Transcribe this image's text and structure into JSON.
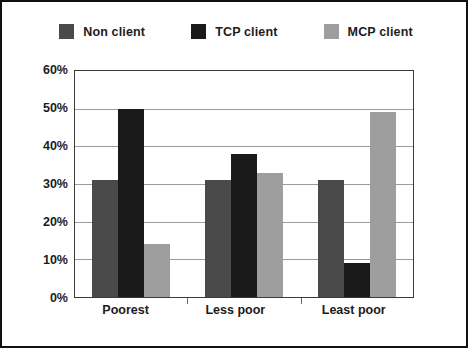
{
  "legend": {
    "entries": [
      {
        "label": "Non client",
        "color": "#4a4a4a",
        "swatch_name": "legend-swatch-non-client"
      },
      {
        "label": "TCP client",
        "color": "#1a1a1a",
        "swatch_name": "legend-swatch-tcp-client"
      },
      {
        "label": "MCP client",
        "color": "#9e9e9e",
        "swatch_name": "legend-swatch-mcp-client"
      }
    ]
  },
  "axis": {
    "y_ticks": [
      "0%",
      "10%",
      "20%",
      "30%",
      "40%",
      "50%",
      "60%"
    ],
    "x_ticks": [
      "Poorest",
      "Less poor",
      "Least poor"
    ]
  },
  "chart_data": {
    "type": "bar",
    "title": "",
    "subtitle": "",
    "xlabel": "",
    "ylabel": "",
    "categories": [
      "Poorest",
      "Less poor",
      "Least poor"
    ],
    "series": [
      {
        "name": "Non client",
        "color": "#4a4a4a",
        "values": [
          31,
          31,
          31
        ]
      },
      {
        "name": "TCP client",
        "color": "#1a1a1a",
        "values": [
          50,
          38,
          9
        ]
      },
      {
        "name": "MCP client",
        "color": "#9e9e9e",
        "values": [
          14,
          33,
          49
        ]
      }
    ],
    "ylim": [
      0,
      60
    ],
    "ytick_step": 10,
    "ytick_labels": [
      "0%",
      "10%",
      "20%",
      "30%",
      "40%",
      "50%",
      "60%"
    ],
    "grid": "horizontal",
    "legend_position": "top-center",
    "value_unit": "percent"
  }
}
